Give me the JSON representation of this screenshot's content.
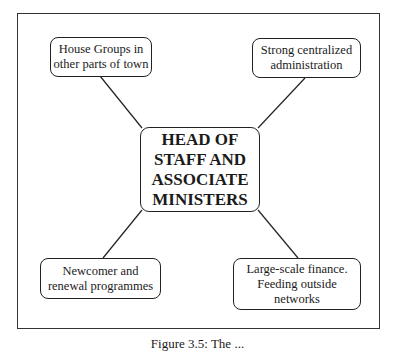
{
  "diagram": {
    "type": "hub-and-spoke",
    "center": {
      "label": "HEAD OF STAFF AND ASSOCIATE MINISTERS",
      "lines": [
        "HEAD OF",
        "STAFF AND",
        "ASSOCIATE",
        "MINISTERS"
      ]
    },
    "nodes": [
      {
        "position": "top-left",
        "lines": [
          "House Groups in",
          "other parts of town"
        ]
      },
      {
        "position": "top-right",
        "lines": [
          "Strong centralized",
          "administration"
        ]
      },
      {
        "position": "bottom-left",
        "lines": [
          "Newcomer and",
          "renewal programmes"
        ]
      },
      {
        "position": "bottom-right",
        "lines": [
          "Large-scale finance.",
          "Feeding outside",
          "networks"
        ]
      }
    ]
  },
  "caption": "Figure 3.5: The ..."
}
